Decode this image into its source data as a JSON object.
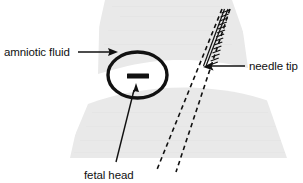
{
  "figure": {
    "type": "ultrasound-amniocentesis-diagram",
    "background_color": "#ffffff",
    "tissue_color": "#e9e9e9",
    "line_color": "#111111",
    "labels": [
      {
        "id": "amniotic-fluid",
        "text": "amniotic fluid",
        "position": "left",
        "arrow": "points-right-to-ellipse"
      },
      {
        "id": "needle-tip",
        "text": "needle tip",
        "position": "right",
        "arrow": "points-left-to-needle"
      },
      {
        "id": "fetal-head",
        "text": "fetal head",
        "position": "bottom",
        "arrow": "points-up-right-into-ellipse"
      }
    ],
    "shapes": {
      "ultrasound_cone": "trapezoidal scan sector, light gray, split by a white curved band",
      "white_band": "amniotic fluid region between upper and lower tissue",
      "ellipse": "fetal head outline, thick black ellipse",
      "ellipse_mark": "short thick horizontal bar inside ellipse",
      "needle": "two dashed lines converging upward with hatched shaft at top"
    }
  }
}
